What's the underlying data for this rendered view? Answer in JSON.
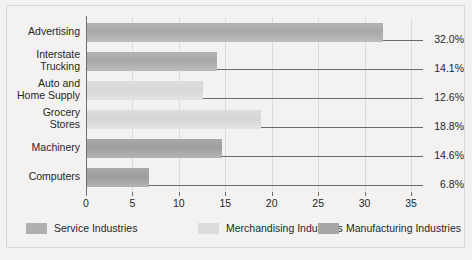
{
  "chart_data": {
    "type": "bar",
    "orientation": "horizontal",
    "title": "",
    "xlabel": "",
    "ylabel": "",
    "xlim": [
      0,
      35
    ],
    "grid": true,
    "legend_position": "bottom",
    "xticks": [
      0,
      5,
      10,
      15,
      20,
      25,
      30,
      35
    ],
    "xtick_labels": [
      "0",
      "5",
      "10",
      "15",
      "20",
      "25",
      "30",
      "35"
    ],
    "categories": [
      "Advertising",
      "Interstate\nTrucking",
      "Auto and\nHome Supply",
      "Grocery\nStores",
      "Machinery",
      "Computers"
    ],
    "values": [
      32.0,
      14.1,
      12.6,
      18.8,
      14.6,
      6.8
    ],
    "value_labels": [
      "32.0%",
      "14.1%",
      "12.6%",
      "18.8%",
      "14.6%",
      "6.8%"
    ],
    "groups": [
      "service",
      "service",
      "merchandising",
      "merchandising",
      "manufacturing",
      "manufacturing"
    ],
    "legend": [
      {
        "label": "Service Industries",
        "key": "service",
        "color": "#b0b0b0"
      },
      {
        "label": "Merchandising Industries",
        "key": "merchandising",
        "color": "#dcdcda"
      },
      {
        "label": "Manufacturing Industries",
        "key": "manufacturing",
        "color": "#a6a6a6"
      }
    ],
    "colors": {
      "background": "#f3f2f0",
      "axis": "#6e6e6e",
      "gridline": "#dcdbd9",
      "leader": "#6b6b6b",
      "text": "#25262a"
    }
  }
}
